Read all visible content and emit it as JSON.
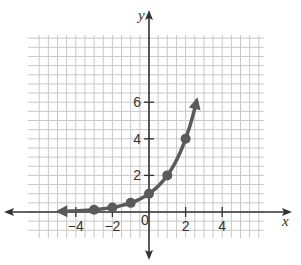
{
  "chart_data": {
    "type": "line",
    "title": "",
    "xlabel": "x",
    "ylabel": "y",
    "xlim": [
      -5.5,
      5.5
    ],
    "ylim": [
      -2,
      8
    ],
    "grid": true,
    "grid_step": 0.5,
    "x_ticks": [
      {
        "value": -4,
        "label": "−4"
      },
      {
        "value": -2,
        "label": "−2"
      },
      {
        "value": 2,
        "label": "2"
      },
      {
        "value": 4,
        "label": "4"
      }
    ],
    "y_ticks": [
      {
        "value": 2,
        "label": "2"
      },
      {
        "value": 4,
        "label": "4"
      },
      {
        "value": 6,
        "label": "6"
      }
    ],
    "origin_label": "0",
    "series": [
      {
        "name": "exponential curve",
        "color": "#5a5a5a",
        "points": [
          {
            "x": -3,
            "y": 0.125
          },
          {
            "x": -2,
            "y": 0.25
          },
          {
            "x": -1,
            "y": 0.5
          },
          {
            "x": 0,
            "y": 1
          },
          {
            "x": 1,
            "y": 2
          },
          {
            "x": 2,
            "y": 4
          }
        ],
        "curve_extends_left_to": -4.9,
        "curve_extends_right_to": 2.6,
        "arrow_left": true,
        "arrow_right": true
      }
    ]
  },
  "style": {
    "grid_color": "#c8c8c8",
    "axis_color": "#333333",
    "curve_color": "#5a5a5a"
  }
}
